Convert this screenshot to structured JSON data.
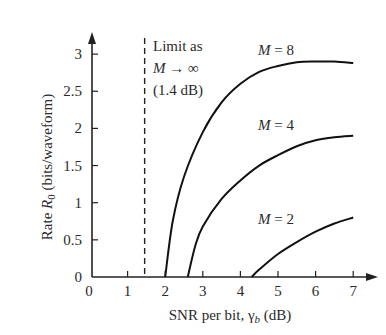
{
  "chart_data": {
    "type": "line",
    "title": "",
    "xlabel": "SNR per bit, γ_b (dB)",
    "xlabel_parts": {
      "prefix": "SNR per bit, ",
      "symbol": "γ",
      "subscript": "b",
      "suffix": " (dB)"
    },
    "ylabel": "Rate R_0 (bits/waveform)",
    "ylabel_parts": {
      "prefix": "Rate ",
      "symbol": "R",
      "subscript": "0",
      "suffix": " (bits/waveform)"
    },
    "xlim": [
      0,
      7
    ],
    "ylim": [
      0,
      3
    ],
    "x_ticks": [
      "0",
      "1",
      "2",
      "3",
      "4",
      "5",
      "6",
      "7"
    ],
    "y_ticks": [
      "0",
      "0.5",
      "1",
      "1.5",
      "2",
      "2.5",
      "3"
    ],
    "grid": false,
    "legend": "inline labels",
    "series": [
      {
        "name": "M = 8",
        "label_parts": {
          "var": "M",
          "rest": " = 8"
        },
        "x": [
          2.0,
          2.2,
          2.5,
          3.0,
          3.5,
          4.0,
          4.5,
          5.0,
          5.5,
          6.0,
          6.5,
          7.0
        ],
        "y": [
          0.0,
          0.75,
          1.35,
          1.95,
          2.35,
          2.6,
          2.76,
          2.84,
          2.89,
          2.9,
          2.9,
          2.88
        ]
      },
      {
        "name": "M = 4",
        "label_parts": {
          "var": "M",
          "rest": " = 4"
        },
        "x": [
          2.6,
          2.8,
          3.0,
          3.5,
          4.0,
          4.5,
          5.0,
          5.5,
          6.0,
          6.5,
          7.0
        ],
        "y": [
          0.0,
          0.42,
          0.68,
          1.05,
          1.3,
          1.5,
          1.64,
          1.76,
          1.84,
          1.88,
          1.9
        ]
      },
      {
        "name": "M = 2",
        "label_parts": {
          "var": "M",
          "rest": " = 2"
        },
        "x": [
          4.3,
          4.5,
          5.0,
          5.5,
          6.0,
          6.5,
          7.0
        ],
        "y": [
          0.0,
          0.1,
          0.31,
          0.47,
          0.61,
          0.72,
          0.8
        ]
      }
    ],
    "annotations": [
      {
        "type": "vline",
        "x": 1.4,
        "style": "dashed",
        "label_lines": [
          "Limit as",
          "M → ∞",
          "(1.4 dB)"
        ]
      }
    ]
  }
}
